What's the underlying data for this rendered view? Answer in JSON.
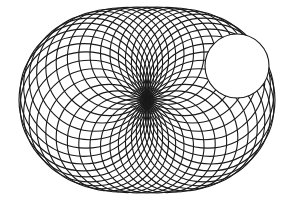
{
  "figure": {
    "background": "#ffffff",
    "stroke_color": "#1a1a1a",
    "center": [
      147,
      100
    ],
    "ellipse_semi_axes": [
      64,
      46.5
    ],
    "circle_count": 40,
    "stroke_width": 1.1,
    "blank_disc": {
      "cx": 237,
      "cy": 66,
      "r": 32,
      "fill": "#ffffff",
      "stroke": "#1a1a1a"
    }
  }
}
